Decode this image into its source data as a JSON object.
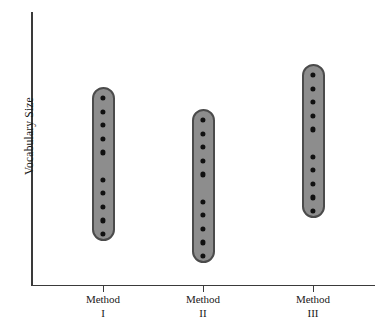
{
  "chart_data": {
    "type": "scatter",
    "title": "",
    "subtitle": "",
    "xlabel": "",
    "ylabel": "Vocabulary Size",
    "grid": false,
    "legend": null,
    "axis_tick_values_shown": false,
    "y_axis_range_labeled": false,
    "categories": [
      "Method I",
      "Method II",
      "Method III"
    ],
    "category_labels_multiline": [
      {
        "line1": "Method",
        "line2": "I"
      },
      {
        "line1": "Method",
        "line2": "II"
      },
      {
        "line1": "Method",
        "line2": "III"
      }
    ],
    "series": [
      {
        "name": "Method I",
        "n_points": 10,
        "values_relative": [
          0.72,
          0.685,
          0.65,
          0.615,
          0.58,
          0.5,
          0.465,
          0.43,
          0.395,
          0.36
        ],
        "range_top_relative": 0.735,
        "range_bottom_relative": 0.345
      },
      {
        "name": "Method II",
        "n_points": 10,
        "values_relative": [
          0.64,
          0.605,
          0.57,
          0.535,
          0.5,
          0.42,
          0.385,
          0.35,
          0.315,
          0.28
        ],
        "range_top_relative": 0.655,
        "range_bottom_relative": 0.265
      },
      {
        "name": "Method III",
        "n_points": 10,
        "values_relative": [
          0.8,
          0.765,
          0.73,
          0.695,
          0.66,
          0.58,
          0.545,
          0.51,
          0.475,
          0.44
        ],
        "range_top_relative": 0.815,
        "range_bottom_relative": 0.425
      }
    ],
    "annotations": []
  },
  "chart_geometry": {
    "columns": [
      {
        "name": "Method I",
        "center_x": 103,
        "top_y": 87,
        "bottom_y": 241,
        "width": 23,
        "dot_count": 10,
        "gap_after_index": 5
      },
      {
        "name": "Method II",
        "center_x": 203,
        "top_y": 109,
        "bottom_y": 263,
        "width": 23,
        "dot_count": 10,
        "gap_after_index": 5
      },
      {
        "name": "Method III",
        "center_x": 313,
        "top_y": 64,
        "bottom_y": 218,
        "width": 23,
        "dot_count": 10,
        "gap_after_index": 5
      }
    ]
  },
  "colors": {
    "capsule_fill": "#8d8d8d",
    "capsule_border": "#4b4b4b",
    "dot": "#101010",
    "axis": "#3a3a3a",
    "text": "#1a1a1a",
    "background": "#ffffff"
  }
}
